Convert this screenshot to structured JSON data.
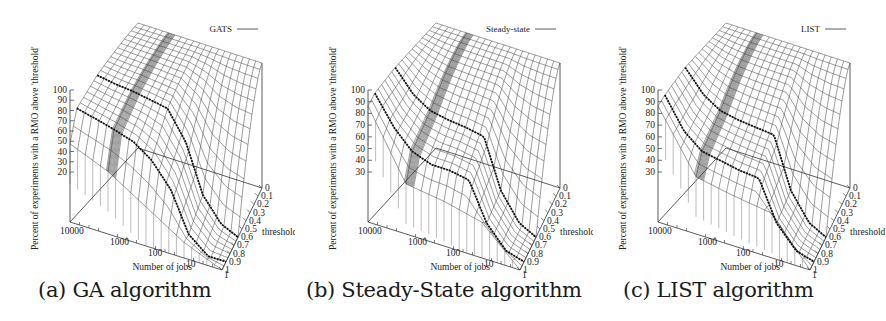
{
  "figure": {
    "panels": [
      {
        "id": "a",
        "caption": "(a) GA algorithm",
        "legend": "GATS",
        "zlabel": "Percent of experiments with a RMO above 'threshold'"
      },
      {
        "id": "b",
        "caption": "(b) Steady-State algorithm",
        "legend": "Steady-state",
        "zlabel": "Percent of experiments with a RMO above 'threshold'"
      },
      {
        "id": "c",
        "caption": "(c) LIST algorithm",
        "legend": "LIST",
        "zlabel": "Percent of experiments with a RMO above 'threshold'"
      }
    ]
  },
  "chart_data": [
    {
      "type": "surface3d",
      "title": "GA algorithm",
      "legend": "GATS",
      "xlabel": "Number of jobs",
      "ylabel": "threshold",
      "zlabel": "Percent of experiments with a RMO above 'threshold'",
      "x_ticks": [
        "10000",
        "1000",
        "100",
        "10",
        "1"
      ],
      "x_scale": "log",
      "y_ticks": [
        "0",
        "0.1",
        "0.2",
        "0.3",
        "0.4",
        "0.5",
        "0.6",
        "0.7",
        "0.8",
        "0.9",
        "1"
      ],
      "z_ticks": [
        20,
        30,
        40,
        50,
        60,
        70,
        80,
        90,
        100
      ],
      "zlim": [
        20,
        100
      ],
      "highlighted_curves": [
        {
          "threshold": 0.0,
          "jobs": [
            10000,
            1000,
            100,
            10,
            1
          ],
          "values": [
            100,
            100,
            100,
            100,
            100
          ]
        },
        {
          "threshold": 0.6,
          "jobs": [
            10000,
            3000,
            1000,
            300,
            100,
            30,
            10,
            3,
            1
          ],
          "values": [
            95,
            93,
            92,
            90,
            88,
            70,
            40,
            25,
            20
          ]
        },
        {
          "threshold": 0.9,
          "jobs": [
            10000,
            3000,
            1000,
            300,
            100,
            30,
            10,
            3,
            1
          ],
          "values": [
            88,
            85,
            82,
            78,
            70,
            55,
            30,
            20,
            20
          ]
        }
      ],
      "edge_values_at_threshold_1": [
        70,
        60,
        45,
        30,
        20
      ]
    },
    {
      "type": "surface3d",
      "title": "Steady-State algorithm",
      "legend": "Steady-state",
      "xlabel": "Number of jobs",
      "ylabel": "threshold",
      "zlabel": "Percent of experiments with a RMO above 'threshold'",
      "x_ticks": [
        "10000",
        "1000",
        "100",
        "10",
        "1"
      ],
      "x_scale": "log",
      "y_ticks": [
        "0",
        "0.1",
        "0.2",
        "0.3",
        "0.4",
        "0.5",
        "0.6",
        "0.7",
        "0.8",
        "0.9",
        "1"
      ],
      "z_ticks": [
        30,
        40,
        50,
        60,
        70,
        80,
        90,
        100
      ],
      "zlim": [
        30,
        100
      ],
      "highlighted_curves": [
        {
          "threshold": 0.0,
          "jobs": [
            10000,
            1000,
            100,
            10,
            1
          ],
          "values": [
            100,
            100,
            100,
            100,
            100
          ]
        },
        {
          "threshold": 0.6,
          "jobs": [
            10000,
            3000,
            1000,
            300,
            100,
            30,
            10,
            3,
            1
          ],
          "values": [
            100,
            88,
            82,
            80,
            79,
            77,
            50,
            35,
            30
          ]
        },
        {
          "threshold": 0.9,
          "jobs": [
            10000,
            3000,
            1000,
            300,
            100,
            30,
            10,
            3,
            1
          ],
          "values": [
            98,
            82,
            72,
            68,
            68,
            66,
            45,
            33,
            30
          ]
        }
      ],
      "edge_values_at_threshold_1": [
        95,
        58,
        55,
        50,
        30
      ]
    },
    {
      "type": "surface3d",
      "title": "LIST algorithm",
      "legend": "LIST",
      "xlabel": "Number of jobs",
      "ylabel": "threshold",
      "zlabel": "Percent of experiments with a RMO above 'threshold'",
      "x_ticks": [
        "10000",
        "1000",
        "100",
        "10",
        "1"
      ],
      "x_scale": "log",
      "y_ticks": [
        "0",
        "0.1",
        "0.2",
        "0.3",
        "0.4",
        "0.5",
        "0.6",
        "0.7",
        "0.8",
        "0.9",
        "1"
      ],
      "z_ticks": [
        30,
        40,
        50,
        60,
        70,
        80,
        90,
        100
      ],
      "zlim": [
        30,
        100
      ],
      "highlighted_curves": [
        {
          "threshold": 0.0,
          "jobs": [
            10000,
            1000,
            100,
            10,
            1
          ],
          "values": [
            100,
            100,
            100,
            100,
            100
          ]
        },
        {
          "threshold": 0.6,
          "jobs": [
            10000,
            3000,
            1000,
            300,
            100,
            30,
            10,
            3,
            1
          ],
          "values": [
            100,
            88,
            82,
            80,
            79,
            78,
            50,
            35,
            30
          ]
        },
        {
          "threshold": 0.9,
          "jobs": [
            10000,
            3000,
            1000,
            300,
            100,
            30,
            10,
            3,
            1
          ],
          "values": [
            97,
            80,
            72,
            70,
            68,
            67,
            45,
            33,
            30
          ]
        }
      ],
      "edge_values_at_threshold_1": [
        95,
        62,
        58,
        55,
        30
      ]
    }
  ]
}
